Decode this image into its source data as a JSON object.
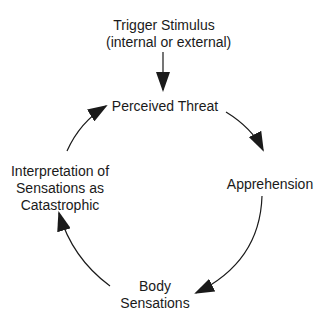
{
  "diagram": {
    "type": "cycle",
    "entry_node": {
      "id": "trigger",
      "lines": [
        "Trigger Stimulus",
        "(internal or external)"
      ]
    },
    "cycle_nodes": [
      {
        "id": "perceived-threat",
        "lines": [
          "Perceived Threat"
        ]
      },
      {
        "id": "apprehension",
        "lines": [
          "Apprehension"
        ]
      },
      {
        "id": "body-sensations",
        "lines": [
          "Body",
          "Sensations"
        ]
      },
      {
        "id": "interpretation",
        "lines": [
          "Interpretation of",
          "Sensations as",
          "Catastrophic"
        ]
      }
    ],
    "edges": [
      {
        "from": "trigger",
        "to": "perceived-threat"
      },
      {
        "from": "perceived-threat",
        "to": "apprehension"
      },
      {
        "from": "apprehension",
        "to": "body-sensations"
      },
      {
        "from": "body-sensations",
        "to": "interpretation"
      },
      {
        "from": "interpretation",
        "to": "perceived-threat"
      }
    ],
    "colors": {
      "line": "#1a1a1a",
      "background": "#ffffff"
    }
  }
}
